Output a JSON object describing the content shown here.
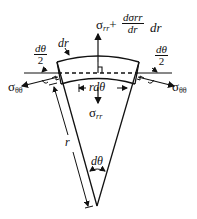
{
  "diagram": {
    "labels": {
      "sigma_rr_top_base": "σ",
      "sigma_rr_top_sub": "rr",
      "plus": "+",
      "dsigma_num": "dσrr",
      "dsigma_den": "dr",
      "dr_after": "dr",
      "dr_label": "dr",
      "dtheta_half_left_num": "dθ",
      "dtheta_half_left_den": "2",
      "dtheta_half_right_num": "dθ",
      "dtheta_half_right_den": "2",
      "sigma_tt_left_base": "σ",
      "sigma_tt_left_sub": "θθ",
      "sigma_tt_right_base": "σ",
      "sigma_tt_right_sub": "θθ",
      "rdtheta": "rdθ",
      "sigma_rr_bottom_base": "σ",
      "sigma_rr_bottom_sub": "rr",
      "r_label": "r",
      "dtheta_label": "dθ"
    },
    "colors": {
      "stroke": "#111111",
      "background": "#ffffff"
    }
  }
}
